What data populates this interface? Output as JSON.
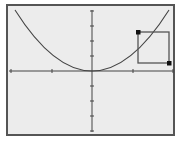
{
  "screen": {
    "background": "#ececec",
    "border_color": "#555555",
    "line_color": "#444444"
  },
  "graph": {
    "x_axis": {
      "ticks_px": [
        11,
        52,
        133,
        173
      ],
      "origin_px": 92
    },
    "y_axis": {
      "ticks_px": [
        11,
        26,
        41,
        56,
        86,
        101,
        116,
        131
      ],
      "origin_px": 71
    },
    "curve": {
      "type": "parabola",
      "vertex_px": [
        92,
        71
      ],
      "equation_approx": "y = x^2"
    },
    "zoom_box": {
      "left": 138,
      "top": 32,
      "right": 169,
      "bottom": 63,
      "corner_markers": [
        "top-left",
        "bottom-right"
      ]
    }
  }
}
